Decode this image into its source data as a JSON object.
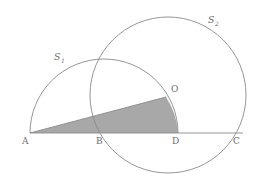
{
  "figure": {
    "background_color": "#ffffff",
    "stroke_color": "#8a8a8a",
    "shade_color": "#a8a8a8",
    "label_color": "#6e6e6e",
    "points": [
      {
        "id": "A",
        "label": "A",
        "x": 30,
        "y": 133,
        "label_x": 22,
        "label_y": 144
      },
      {
        "id": "B",
        "label": "B",
        "x": 101,
        "y": 133,
        "label_x": 96,
        "label_y": 144
      },
      {
        "id": "D",
        "label": "D",
        "x": 178,
        "y": 133,
        "label_x": 172,
        "label_y": 144
      },
      {
        "id": "C",
        "label": "C",
        "x": 237,
        "y": 133,
        "label_x": 233,
        "label_y": 144
      },
      {
        "id": "O",
        "label": "O",
        "x": 166,
        "y": 97,
        "label_x": 171,
        "label_y": 92
      }
    ],
    "curves": [
      {
        "id": "S1",
        "label": "S",
        "sub": "1",
        "kind": "semicircle",
        "center_x": 104,
        "center_y": 133,
        "radius": 74,
        "label_x": 54,
        "label_y": 60,
        "sub_x": 62,
        "sub_y": 63
      },
      {
        "id": "S2",
        "label": "S",
        "sub": "2",
        "kind": "circle",
        "center_x": 168,
        "center_y": 95,
        "radius": 78,
        "label_x": 208,
        "label_y": 23,
        "sub_x": 216,
        "sub_y": 26
      }
    ],
    "baseline": {
      "from": "A",
      "to": "C",
      "y": 133,
      "x1": 30,
      "x2": 243
    },
    "shaded_region": {
      "name": "shaded-sector",
      "description": "Region bounded by chord A-O, arc O-D of S1, and segment D-A",
      "path": "M 30 133 L 166 97 A 74 74 0 0 1 178 133 Z"
    },
    "chord": {
      "name": "chord-AO",
      "x1": 30,
      "y1": 133,
      "x2": 166,
      "y2": 97
    }
  }
}
